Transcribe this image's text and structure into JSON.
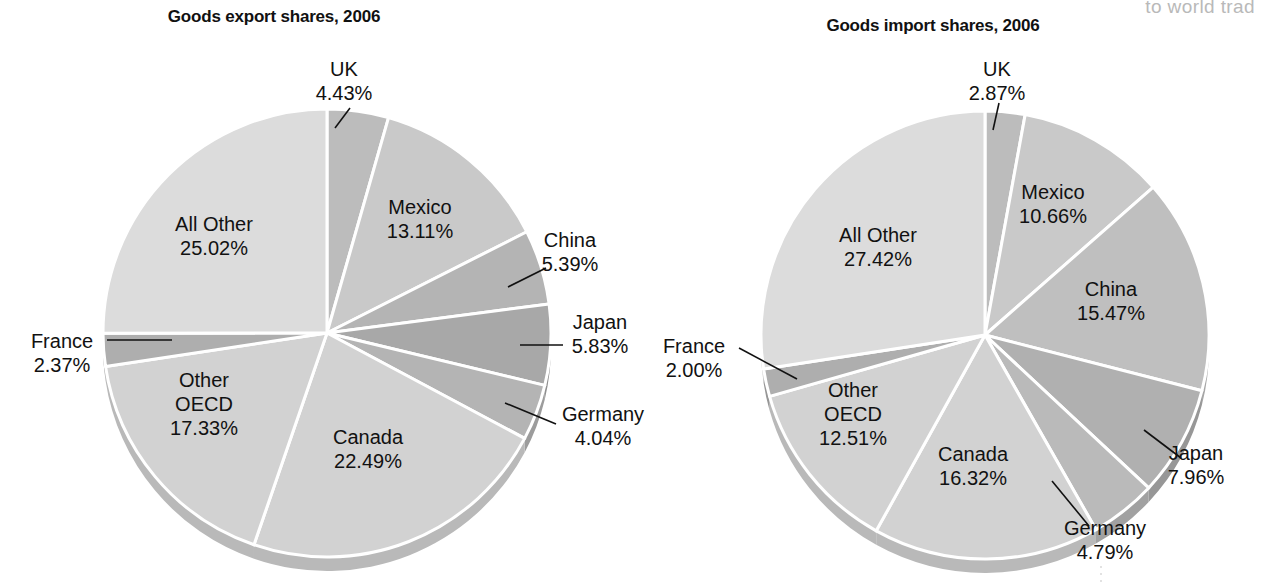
{
  "page": {
    "background_color": "#ffffff",
    "cropped_header_text": "to world trad",
    "text_color": "#111111",
    "separator_color": "#ffffff"
  },
  "chart_data": [
    {
      "type": "pie",
      "id": "goods-export-shares",
      "title": "Goods export shares, 2006",
      "title_x": 274,
      "title_y": 22,
      "center_x": 327,
      "center_y": 333,
      "radius": 224,
      "depth": 14,
      "start_angle_deg": -90,
      "direction": "clockwise",
      "units": "percent",
      "total": 100,
      "categories": [
        "UK",
        "Mexico",
        "China",
        "Japan",
        "Germany",
        "Canada",
        "Other OECD",
        "France",
        "All Other"
      ],
      "values": [
        4.43,
        13.11,
        5.39,
        5.83,
        4.04,
        22.49,
        17.33,
        2.37,
        25.02
      ],
      "slices": [
        {
          "name": "UK",
          "value": 4.43,
          "label": "UK",
          "value_label": "4.43%",
          "color": "#bcbcbc",
          "side_color": "#a4a4a4",
          "label_x": 344,
          "label_y": 76,
          "anchor": "middle",
          "leader": "M 350,108 L 335,128"
        },
        {
          "name": "Mexico",
          "value": 13.11,
          "label": "Mexico",
          "value_label": "13.11%",
          "color": "#c9c9c9",
          "side_color": "#b0b0b0",
          "label_x": 420,
          "label_y": 214,
          "anchor": "middle",
          "leader": ""
        },
        {
          "name": "China",
          "value": 5.39,
          "label": "China",
          "value_label": "5.39%",
          "color": "#b4b4b4",
          "side_color": "#9c9c9c",
          "label_x": 570,
          "label_y": 247,
          "anchor": "middle",
          "leader": "M 508,287 L 546,268"
        },
        {
          "name": "Japan",
          "value": 5.83,
          "label": "Japan",
          "value_label": "5.83%",
          "color": "#a8a8a8",
          "side_color": "#8f8f8f",
          "label_x": 600,
          "label_y": 329,
          "anchor": "middle",
          "leader": "M 520,345 L 563,345"
        },
        {
          "name": "Germany",
          "value": 4.04,
          "label": "Germany",
          "value_label": "4.04%",
          "color": "#b4b4b4",
          "side_color": "#9c9c9c",
          "label_x": 603,
          "label_y": 421,
          "anchor": "middle",
          "leader": "M 505,403 L 556,424"
        },
        {
          "name": "Canada",
          "value": 22.49,
          "label": "Canada",
          "value_label": "22.49%",
          "color": "#d2d2d2",
          "side_color": "#b9b9b9",
          "label_x": 368,
          "label_y": 444,
          "anchor": "middle",
          "leader": ""
        },
        {
          "name": "Other OECD",
          "value": 17.33,
          "label": "Other",
          "label2": "OECD",
          "value_label": "17.33%",
          "color": "#d2d2d2",
          "side_color": "#b9b9b9",
          "label_x": 204,
          "label_y": 387,
          "anchor": "middle",
          "leader": ""
        },
        {
          "name": "France",
          "value": 2.37,
          "label": "France",
          "value_label": "2.37%",
          "color": "#aeaeae",
          "side_color": "#969696",
          "label_x": 62,
          "label_y": 348,
          "anchor": "middle",
          "leader": "M 107,340 L 172,340"
        },
        {
          "name": "All Other",
          "value": 25.02,
          "label": "All Other",
          "value_label": "25.02%",
          "color": "#dcdcdc",
          "side_color": "#c3c3c3",
          "label_x": 214,
          "label_y": 231,
          "anchor": "middle",
          "leader": ""
        }
      ]
    },
    {
      "type": "pie",
      "id": "goods-import-shares",
      "title": "Goods import shares, 2006",
      "title_x": 933,
      "title_y": 31,
      "center_x": 985,
      "center_y": 335,
      "radius": 224,
      "depth": 14,
      "start_angle_deg": -90,
      "direction": "clockwise",
      "units": "percent",
      "total": 100,
      "categories": [
        "UK",
        "Mexico",
        "China",
        "Japan",
        "Germany",
        "Canada",
        "Other OECD",
        "France",
        "All Other"
      ],
      "values": [
        2.87,
        10.66,
        15.47,
        7.96,
        4.79,
        16.32,
        12.51,
        2.0,
        27.42
      ],
      "slices": [
        {
          "name": "UK",
          "value": 2.87,
          "label": "UK",
          "value_label": "2.87%",
          "color": "#bcbcbc",
          "side_color": "#a4a4a4",
          "label_x": 997,
          "label_y": 76,
          "anchor": "middle",
          "leader": "M 999,103 L 993,130"
        },
        {
          "name": "Mexico",
          "value": 10.66,
          "label": "Mexico",
          "value_label": "10.66%",
          "color": "#c9c9c9",
          "side_color": "#b0b0b0",
          "label_x": 1053,
          "label_y": 199,
          "anchor": "middle",
          "leader": ""
        },
        {
          "name": "China",
          "value": 15.47,
          "label": "China",
          "value_label": "15.47%",
          "color": "#bfbfbf",
          "side_color": "#a6a6a6",
          "label_x": 1111,
          "label_y": 296,
          "anchor": "middle",
          "leader": ""
        },
        {
          "name": "Japan",
          "value": 7.96,
          "label": "Japan",
          "value_label": "7.96%",
          "color": "#b0b0b0",
          "side_color": "#979797",
          "label_x": 1196,
          "label_y": 460,
          "anchor": "middle",
          "leader": "M 1144,430 L 1181,458"
        },
        {
          "name": "Germany",
          "value": 4.79,
          "label": "Germany",
          "value_label": "4.79%",
          "color": "#bababa",
          "side_color": "#a1a1a1",
          "label_x": 1105,
          "label_y": 535,
          "anchor": "middle",
          "leader": "M 1052,481 L 1089,526"
        },
        {
          "name": "Canada",
          "value": 16.32,
          "label": "Canada",
          "value_label": "16.32%",
          "color": "#d2d2d2",
          "side_color": "#b9b9b9",
          "label_x": 973,
          "label_y": 461,
          "anchor": "middle",
          "leader": ""
        },
        {
          "name": "Other OECD",
          "value": 12.51,
          "label": "Other",
          "label2": "OECD",
          "value_label": "12.51%",
          "color": "#d2d2d2",
          "side_color": "#b9b9b9",
          "label_x": 853,
          "label_y": 397,
          "anchor": "middle",
          "leader": ""
        },
        {
          "name": "France",
          "value": 2.0,
          "label": "France",
          "value_label": "2.00%",
          "color": "#aeaeae",
          "side_color": "#969696",
          "label_x": 694,
          "label_y": 353,
          "anchor": "middle",
          "leader": "M 739,348 L 797,379"
        },
        {
          "name": "All Other",
          "value": 27.42,
          "label": "All Other",
          "value_label": "27.42%",
          "color": "#dcdcdc",
          "side_color": "#c3c3c3",
          "label_x": 878,
          "label_y": 242,
          "anchor": "middle",
          "leader": ""
        }
      ]
    }
  ]
}
